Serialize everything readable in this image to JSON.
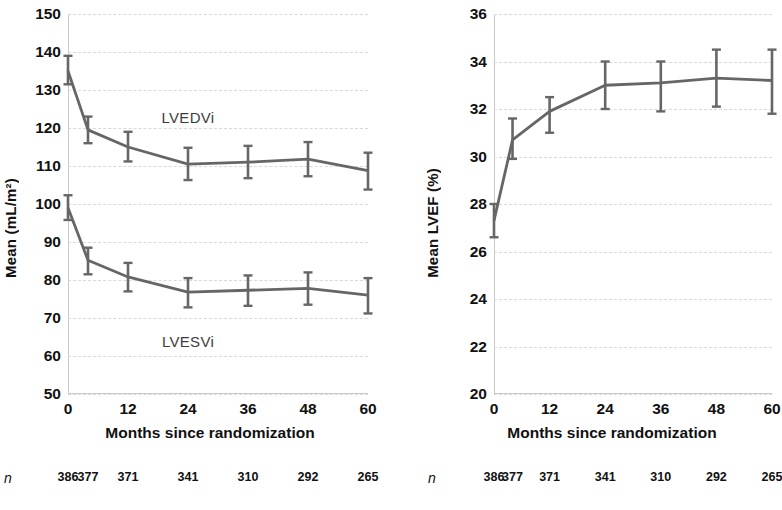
{
  "chart_data": [
    {
      "type": "line",
      "panel": "left",
      "title": "",
      "xlabel": "Months since randomization",
      "ylabel": "Mean (mL/m²)",
      "ylim": [
        50,
        150
      ],
      "yticks": [
        50,
        60,
        70,
        80,
        90,
        100,
        110,
        120,
        130,
        140,
        150
      ],
      "xlim": [
        0,
        60
      ],
      "xticks": [
        0,
        12,
        24,
        36,
        48,
        60
      ],
      "x": [
        0,
        4,
        12,
        24,
        36,
        48,
        60
      ],
      "grid": true,
      "legend": "inline-annotations",
      "series": [
        {
          "name": "LVEDVi",
          "values": [
            135.0,
            119.5,
            115.0,
            110.5,
            111.0,
            111.8,
            108.8
          ],
          "err_low": [
            131.5,
            116.0,
            111.2,
            106.3,
            106.8,
            107.3,
            103.8
          ],
          "err_high": [
            139.0,
            123.0,
            119.0,
            114.8,
            115.3,
            116.3,
            113.5
          ],
          "annotation": "LVEDVi",
          "annotation_x": 24,
          "annotation_y": 123
        },
        {
          "name": "LVESVi",
          "values": [
            99.0,
            85.2,
            80.8,
            76.8,
            77.3,
            77.8,
            76.0
          ],
          "err_low": [
            95.8,
            81.5,
            77.0,
            72.8,
            73.2,
            73.5,
            71.2
          ],
          "err_high": [
            102.3,
            88.5,
            84.5,
            80.5,
            81.2,
            82.0,
            80.5
          ],
          "annotation": "LVESVi",
          "annotation_x": 24,
          "annotation_y": 64
        }
      ],
      "n_label": "n",
      "n_values": [
        386,
        377,
        371,
        341,
        310,
        292,
        265
      ]
    },
    {
      "type": "line",
      "panel": "right",
      "title": "",
      "xlabel": "Months since randomization",
      "ylabel": "Mean LVEF (%)",
      "ylim": [
        20,
        36
      ],
      "yticks": [
        20,
        22,
        24,
        26,
        28,
        30,
        32,
        34,
        36
      ],
      "xlim": [
        0,
        60
      ],
      "xticks": [
        0,
        12,
        24,
        36,
        48,
        60
      ],
      "x": [
        0,
        4,
        12,
        24,
        36,
        48,
        60
      ],
      "grid": true,
      "legend": "none",
      "series": [
        {
          "name": "LVEF",
          "values": [
            27.3,
            30.7,
            31.9,
            33.0,
            33.1,
            33.3,
            33.2
          ],
          "err_low": [
            26.6,
            29.9,
            31.0,
            32.0,
            31.9,
            32.1,
            31.8
          ],
          "err_high": [
            28.0,
            31.6,
            32.5,
            34.0,
            34.0,
            34.5,
            34.5
          ]
        }
      ],
      "n_label": "n",
      "n_values": [
        386,
        377,
        371,
        341,
        310,
        292,
        265
      ]
    }
  ],
  "style": {
    "line_color": "#666666",
    "error_bar_color": "#666666",
    "grid_color": "#d9d9d9",
    "axis_color": "#c9c9c9",
    "text_color": "#111111",
    "background": "#ffffff"
  }
}
